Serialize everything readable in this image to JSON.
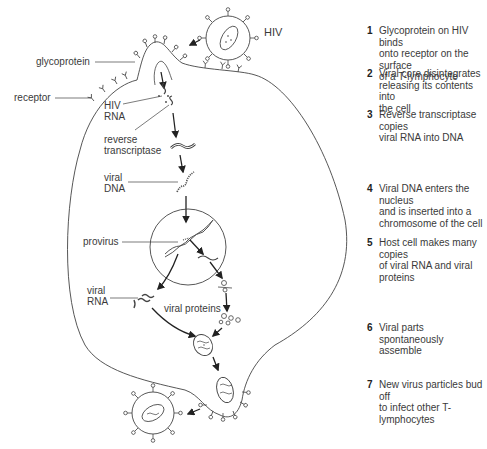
{
  "labels": {
    "hiv": "HIV",
    "glycoprotein": "glycoprotein",
    "receptor": "receptor",
    "hiv_rna": "HIV\nRNA",
    "reverse_transcriptase": "reverse\ntranscriptase",
    "viral_dna": "viral\nDNA",
    "provirus": "provirus",
    "viral_rna": "viral\nRNA",
    "viral_proteins": "viral proteins"
  },
  "steps": [
    {
      "num": "1",
      "text": "Glycoprotein on HIV binds\nonto receptor on the surface\nof a T-lymphocyte"
    },
    {
      "num": "2",
      "text": "Viral core disintegrates\nreleasing its contents into\nthe cell"
    },
    {
      "num": "3",
      "text": "Reverse transcriptase copies\nviral RNA into DNA"
    },
    {
      "num": "4",
      "text": "Viral DNA enters the nucleus\nand is inserted into a\nchromosome of the cell"
    },
    {
      "num": "5",
      "text": "Host cell makes many copies\nof viral RNA and viral proteins"
    },
    {
      "num": "6",
      "text": "Viral parts spontaneously\nassemble"
    },
    {
      "num": "7",
      "text": "New virus particles bud off\nto infect other T-lymphocytes"
    }
  ],
  "colors": {
    "line": "#444444",
    "text": "#3a3a3a",
    "background": "#ffffff"
  }
}
